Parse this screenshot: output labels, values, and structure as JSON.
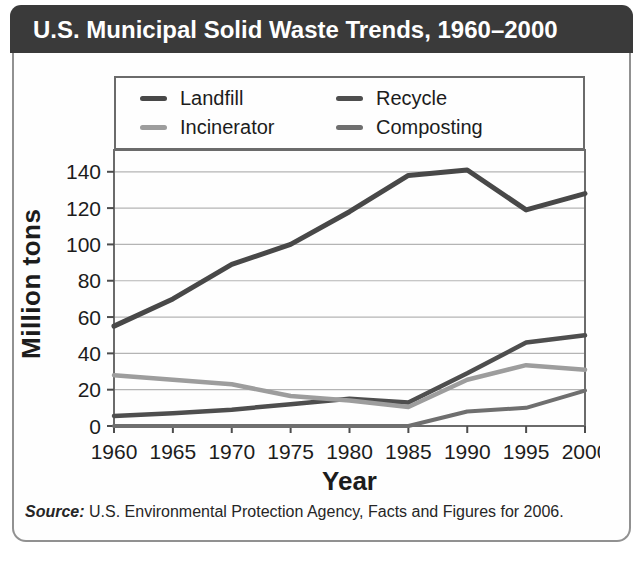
{
  "title": "U.S. Municipal Solid Waste Trends, 1960–2000",
  "source": {
    "label": "Source:",
    "text": " U.S. Environmental Protection Agency, Facts and Figures for 2006."
  },
  "colors": {
    "title_bar_bg": "#3a3a3a",
    "title_text": "#ffffff",
    "card_border": "#919191",
    "box_border": "#6b6b6b",
    "gridline": "#b4b4b4",
    "axis": "#4d4d4d",
    "tick_text": "#1c1c1c"
  },
  "chart_data": {
    "type": "line",
    "title": "U.S. Municipal Solid Waste Trends, 1960–2000",
    "xlabel": "Year",
    "ylabel": "Million tons",
    "x": [
      1960,
      1965,
      1970,
      1975,
      1980,
      1985,
      1990,
      1995,
      2000
    ],
    "x_ticks": [
      1960,
      1965,
      1970,
      1975,
      1980,
      1985,
      1990,
      1995,
      2000
    ],
    "y_ticks": [
      0,
      20,
      40,
      60,
      80,
      100,
      120,
      140
    ],
    "xlim": [
      1960,
      2000
    ],
    "ylim": [
      0,
      152
    ],
    "grid": "horizontal",
    "legend_position": "top",
    "series": [
      {
        "name": "Landfill",
        "color": "#484848",
        "width": 5,
        "values": [
          55,
          70,
          89,
          100,
          118,
          138,
          141,
          119,
          128
        ]
      },
      {
        "name": "Recycle",
        "color": "#4e4e4e",
        "width": 4.5,
        "values": [
          5.5,
          7,
          9,
          12,
          15,
          13,
          29,
          46,
          50
        ]
      },
      {
        "name": "Incinerator",
        "color": "#9d9d9d",
        "width": 4.5,
        "values": [
          28,
          25.5,
          23,
          16.5,
          14,
          10.5,
          25.5,
          33.5,
          31
        ]
      },
      {
        "name": "Composting",
        "color": "#6f6f6f",
        "width": 4,
        "values": [
          0,
          0,
          0,
          0,
          0,
          0,
          8,
          10,
          19.5
        ]
      }
    ]
  }
}
